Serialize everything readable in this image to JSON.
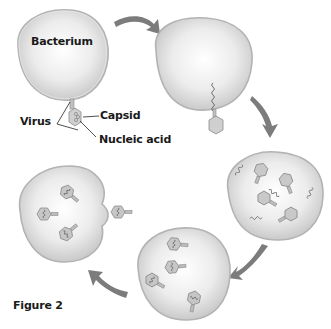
{
  "diagram": {
    "type": "cycle",
    "title": "Figure 2",
    "labels": {
      "bacterium": "Bacterium",
      "virus": "Virus",
      "capsid": "Capsid",
      "nucleic_acid": "Nucleic acid",
      "figure": "Figure 2"
    },
    "stages": [
      {
        "id": "stage-1",
        "description": "Virus attaches to bacterium"
      },
      {
        "id": "stage-2",
        "description": "Virus injects nucleic acid into bacterium"
      },
      {
        "id": "stage-3",
        "description": "Viral parts are replicated inside bacterium"
      },
      {
        "id": "stage-4",
        "description": "New viruses assemble inside bacterium"
      },
      {
        "id": "stage-5",
        "description": "Viruses burst out of bacterium"
      }
    ],
    "arrows": [
      {
        "from": "stage-1",
        "to": "stage-2"
      },
      {
        "from": "stage-2",
        "to": "stage-3"
      },
      {
        "from": "stage-3",
        "to": "stage-4"
      },
      {
        "from": "stage-4",
        "to": "stage-5"
      }
    ],
    "colors": {
      "cell_fill_center": "#ffffff",
      "cell_fill_edge": "#c8c8c8",
      "cell_outline": "#b0b0b0",
      "arrow": "#7a7a7a",
      "virus_fill": "#c4c4c4",
      "virus_stroke": "#8a8a8a",
      "label_text": "#1a1a1a"
    }
  }
}
